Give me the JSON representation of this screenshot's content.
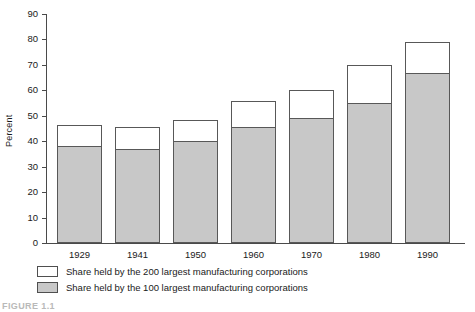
{
  "chart_data": {
    "type": "bar",
    "title": "",
    "subtitle": "",
    "xlabel": "",
    "ylabel": "Percent",
    "categories": [
      "1929",
      "1941",
      "1950",
      "1960",
      "1970",
      "1980",
      "1990"
    ],
    "series": [
      {
        "name": "Share held by the 100 largest manufacturing corporations",
        "color": "#c8c8c8",
        "values": [
          38,
          37,
          40,
          45.5,
          49,
          55,
          67
        ]
      },
      {
        "name": "Share held by the 200 largest manufacturing corporations",
        "color": "#ffffff",
        "values": [
          46.5,
          45.5,
          48.5,
          56,
          60,
          70,
          79
        ]
      }
    ],
    "stacked": true,
    "stack_note": "White segment is drawn on top of the gray segment; white top edge equals the 200-largest cumulative total.",
    "ylim": [
      0,
      90
    ],
    "yticks": [
      0,
      10,
      20,
      30,
      40,
      50,
      60,
      70,
      80,
      90
    ],
    "grid": false,
    "legend_position": "below-axis-left"
  },
  "axes": {
    "y_title": "Percent",
    "y_tick_labels": [
      "90",
      "80",
      "70",
      "60",
      "50",
      "40",
      "30",
      "20",
      "10",
      "0"
    ],
    "x_tick_labels": [
      "1929",
      "1941",
      "1950",
      "1960",
      "1970",
      "1980",
      "1990"
    ]
  },
  "legend": {
    "items": [
      {
        "swatch": "white-swatch",
        "label": "Share held by the 200 largest manufacturing corporations"
      },
      {
        "swatch": "gray-swatch",
        "label": "Share held by the 100 largest manufacturing corporations"
      }
    ]
  },
  "caption": {
    "text": "FIGURE 1.1"
  },
  "colors": {
    "gray_fill": "#c8c8c8",
    "white_fill": "#ffffff",
    "bar_border": "#585858",
    "axis": "#4a4a4a"
  }
}
